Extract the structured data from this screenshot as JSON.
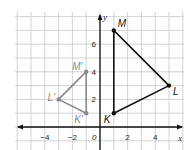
{
  "diagram": {
    "type": "coordinate-plane",
    "axes": {
      "x_label": "x",
      "y_label": "y",
      "origin_label": "0",
      "x_ticks": [
        {
          "value": -4,
          "label": "−4"
        },
        {
          "value": -2,
          "label": "−2"
        },
        {
          "value": 2,
          "label": "2"
        },
        {
          "value": 4,
          "label": "4"
        }
      ],
      "y_ticks": [
        {
          "value": 2,
          "label": "2"
        },
        {
          "value": 4,
          "label": "4"
        },
        {
          "value": 6,
          "label": "6"
        }
      ],
      "x_range": [
        -6,
        6
      ],
      "y_range": [
        -1,
        8
      ]
    },
    "triangles": [
      {
        "name": "KLM",
        "color": "#111111",
        "vertices": [
          {
            "label": "K",
            "x": 1,
            "y": 1
          },
          {
            "label": "L",
            "x": 5,
            "y": 3
          },
          {
            "label": "M",
            "x": 1,
            "y": 7
          }
        ]
      },
      {
        "name": "K'L'M'",
        "color": "#8a8a8a",
        "vertices": [
          {
            "label": "K'",
            "x": -1,
            "y": 1
          },
          {
            "label": "L'",
            "x": -3,
            "y": 2
          },
          {
            "label": "M'",
            "x": -1,
            "y": 4
          }
        ]
      }
    ],
    "colors": {
      "grid": "#c8c8c8",
      "axis": "#111111"
    }
  }
}
